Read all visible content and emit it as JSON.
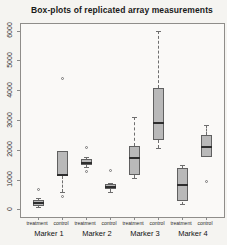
{
  "figure": {
    "title": "Box-plots of replicated array measurements"
  },
  "colors": {
    "background": "#f5f4f1",
    "plot_background": "#faf9f7",
    "frame_border": "#8f8d8a",
    "box_fill": "#b9b9b9",
    "box_border": "#606060",
    "median": "#2e2e2e",
    "whisker": "#6e6e6e",
    "outlier": "#777777",
    "tick": "#8a8a8a",
    "text": "#1a1a1a"
  },
  "chart_data": {
    "type": "boxplot",
    "title": "Box-plots of replicated array measurements",
    "xlabel": "",
    "ylabel": "",
    "ylim": [
      0,
      6000
    ],
    "yticks": [
      "0",
      "1000",
      "2000",
      "3000",
      "4000",
      "5000",
      "6000"
    ],
    "ytick_values": [
      0,
      1000,
      2000,
      3000,
      4000,
      5000,
      6000
    ],
    "grid": false,
    "legend": false,
    "group_labels": [
      "Marker 1",
      "Marker 2",
      "Marker 3",
      "Marker 4"
    ],
    "categories": [
      "treatment",
      "control",
      "treatment",
      "control",
      "treatment",
      "control",
      "treatment",
      "control"
    ],
    "boxes": [
      {
        "marker": "Marker 1",
        "condition": "treatment",
        "whisker_low": 80,
        "q1": 130,
        "median": 240,
        "q3": 330,
        "whisker_high": 390,
        "outliers": [
          690
        ]
      },
      {
        "marker": "Marker 1",
        "condition": "control",
        "whisker_low": 610,
        "q1": 1120,
        "median": 1180,
        "q3": 1980,
        "whisker_high": 1980,
        "outliers": [
          4420,
          440
        ]
      },
      {
        "marker": "Marker 2",
        "condition": "treatment",
        "whisker_low": 1430,
        "q1": 1500,
        "median": 1560,
        "q3": 1700,
        "whisker_high": 1790,
        "outliers": [
          2080,
          1280
        ]
      },
      {
        "marker": "Marker 2",
        "condition": "control",
        "whisker_low": 610,
        "q1": 700,
        "median": 780,
        "q3": 860,
        "whisker_high": 910,
        "outliers": [
          1330
        ]
      },
      {
        "marker": "Marker 3",
        "condition": "treatment",
        "whisker_low": 1060,
        "q1": 1180,
        "median": 1730,
        "q3": 2130,
        "whisker_high": 3110,
        "outliers": []
      },
      {
        "marker": "Marker 3",
        "condition": "control",
        "whisker_low": 2070,
        "q1": 2350,
        "median": 2920,
        "q3": 4100,
        "whisker_high": 6010,
        "outliers": []
      },
      {
        "marker": "Marker 4",
        "condition": "treatment",
        "whisker_low": 210,
        "q1": 280,
        "median": 850,
        "q3": 1400,
        "whisker_high": 1490,
        "outliers": []
      },
      {
        "marker": "Marker 4",
        "condition": "control",
        "whisker_low": 1790,
        "q1": 1790,
        "median": 2120,
        "q3": 2500,
        "whisker_high": 2840,
        "outliers": [
          950
        ]
      }
    ]
  }
}
